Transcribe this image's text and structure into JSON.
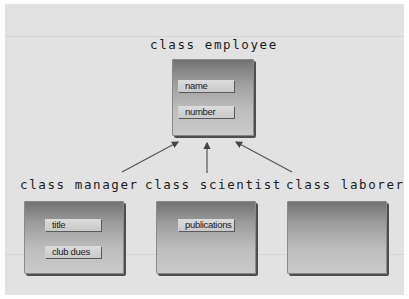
{
  "diagram": {
    "base_class": {
      "title": "class employee",
      "attributes": [
        "name",
        "number"
      ]
    },
    "derived_classes": [
      {
        "title": "class manager",
        "attributes": [
          "title",
          "club dues"
        ]
      },
      {
        "title": "class scientist",
        "attributes": [
          "publications"
        ]
      },
      {
        "title": "class laborer",
        "attributes": []
      }
    ],
    "relationship": "inheritance (derived classes point to base class)",
    "colors": {
      "background": "#e2e2e2",
      "box_top": "#707070",
      "box_bottom": "#cacaca",
      "attribute_fill": "#d4d4d4",
      "arrow": "#444444",
      "text": "#1b1b1b"
    }
  }
}
